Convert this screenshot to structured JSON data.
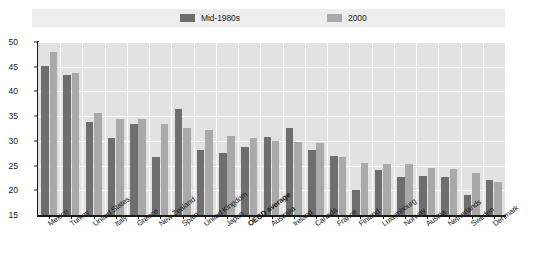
{
  "legend": {
    "entries": [
      {
        "label": "Mid-1980s",
        "color": "#6e6e6e",
        "swatch_name": "legend-swatch-mid-1980s"
      },
      {
        "label": "2000",
        "color": "#a9a9a9",
        "swatch_name": "legend-swatch-2000"
      }
    ]
  },
  "chart_data": {
    "type": "bar",
    "title": "",
    "subtitle": "",
    "xlabel": "",
    "ylabel": "",
    "ylim": [
      15,
      50
    ],
    "yticks": [
      15,
      20,
      25,
      30,
      35,
      40,
      45,
      50
    ],
    "grid": true,
    "legend_position": "top",
    "highlight_category": "OECD average",
    "categories": [
      "Mexico",
      "Turkey",
      "United States",
      "Italy",
      "Greece",
      "New Zealand",
      "Spain",
      "United Kingdom",
      "Japan",
      "OECD average",
      "Australia",
      "Ireland",
      "Canada",
      "France",
      "Finland",
      "Luxembourg",
      "Norway",
      "Austria",
      "Netherlands",
      "Sweden",
      "Denmark"
    ],
    "series": [
      {
        "name": "Mid-1980s",
        "color": "#6e6e6e",
        "values": [
          45.2,
          43.4,
          33.8,
          30.5,
          33.5,
          26.8,
          36.5,
          28.2,
          27.5,
          28.8,
          30.7,
          32.7,
          28.2,
          27.0,
          20.1,
          24.1,
          22.7,
          22.9,
          22.6,
          19.1,
          22.0
        ]
      },
      {
        "name": "2000",
        "color": "#a9a9a9",
        "values": [
          48.0,
          43.8,
          35.7,
          34.5,
          34.4,
          33.5,
          32.6,
          32.3,
          31.0,
          30.6,
          30.0,
          29.8,
          29.6,
          26.7,
          25.6,
          25.4,
          25.4,
          24.5,
          24.4,
          23.4,
          21.6
        ]
      }
    ]
  },
  "colors": {
    "plot_background": "#e2e2e2",
    "gridline": "#ffffff",
    "legend_background": "#ededed",
    "axis": "#1a1a1a"
  }
}
